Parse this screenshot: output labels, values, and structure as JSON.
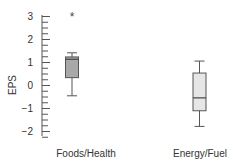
{
  "chart_data": {
    "type": "boxplot",
    "title": "",
    "xlabel": "",
    "ylabel": "EPS",
    "ylim": [
      -2.3,
      3.3
    ],
    "yticks": [
      -2,
      -1,
      0,
      1,
      2,
      3
    ],
    "minor_tick_step": 0.25,
    "grid": false,
    "legend": null,
    "categories": [
      "Foods/Health",
      "Energy/Fuel"
    ],
    "series": [
      {
        "name": "Foods/Health",
        "whisker_low": -0.47,
        "q1": 0.32,
        "median": 1.12,
        "q3": 1.22,
        "whisker_high": 1.4,
        "outliers": [
          3.0
        ],
        "fill": "#a8a8a8"
      },
      {
        "name": "Energy/Fuel",
        "whisker_low": -1.8,
        "q1": -1.12,
        "median": -0.56,
        "q3": 0.52,
        "whisker_high": 1.04,
        "outliers": [],
        "fill": "#e6e6e6"
      }
    ]
  }
}
